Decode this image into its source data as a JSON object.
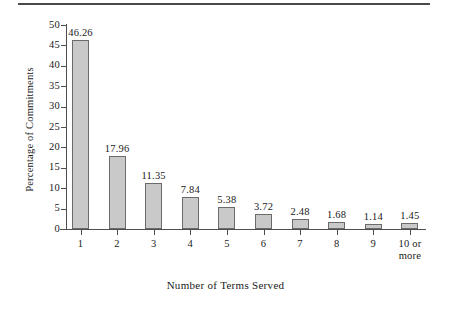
{
  "chart_data": {
    "type": "bar",
    "title": "",
    "xlabel": "Number of Terms Served",
    "ylabel": "Percentage of Commitments",
    "categories": [
      "1",
      "2",
      "3",
      "4",
      "5",
      "6",
      "7",
      "8",
      "9",
      "10 or\nmore"
    ],
    "values": [
      46.26,
      17.96,
      11.35,
      7.84,
      5.38,
      3.72,
      2.48,
      1.68,
      1.14,
      1.45
    ],
    "value_labels": [
      "46.26",
      "17.96",
      "11.35",
      "7.84",
      "5.38",
      "3.72",
      "2.48",
      "1.68",
      "1.14",
      "1.45"
    ],
    "ylim": [
      0,
      50
    ],
    "ytick_labels": [
      "0",
      "5",
      "10",
      "15",
      "20",
      "25",
      "30",
      "35",
      "40",
      "45",
      "50"
    ],
    "ytick_values": [
      0,
      5,
      10,
      15,
      20,
      25,
      30,
      35,
      40,
      45,
      50
    ],
    "grid": false,
    "legend": null,
    "bar_fill_color": "#c9c9c9",
    "bar_border_color": "#6b6b6b",
    "axis_color": "#4e4e4e",
    "text_color": "#1a1a1a",
    "background_color": "#ffffff"
  },
  "decoration": {
    "top_rule_color": "#4a4a4a"
  }
}
